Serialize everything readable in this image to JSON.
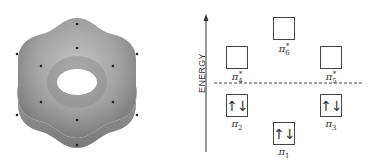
{
  "left": {
    "title": "benzene pi electron density surface",
    "surface_color": "#9a9a9a",
    "atoms": {
      "hydrogens": [
        [
          17,
          54
        ],
        [
          137,
          54
        ],
        [
          17,
          115
        ],
        [
          137,
          115
        ],
        [
          77,
          24
        ],
        [
          77,
          145
        ]
      ],
      "carbons": [
        [
          77,
          48
        ],
        [
          41,
          66
        ],
        [
          113,
          66
        ],
        [
          41,
          102
        ],
        [
          113,
          102
        ],
        [
          77,
          120
        ]
      ]
    }
  },
  "right": {
    "axis_label": "ENERGY",
    "orbitals": [
      {
        "id": "pi6",
        "symbol": "π",
        "sub": "6",
        "sup": "*",
        "occupied": false,
        "electrons": ""
      },
      {
        "id": "pi4",
        "symbol": "π",
        "sub": "4",
        "sup": "*",
        "occupied": false,
        "electrons": ""
      },
      {
        "id": "pi5",
        "symbol": "π",
        "sub": "5",
        "sup": "*",
        "occupied": false,
        "electrons": ""
      },
      {
        "id": "pi2",
        "symbol": "π",
        "sub": "2",
        "sup": "",
        "occupied": true,
        "electrons": "↑↓"
      },
      {
        "id": "pi3",
        "symbol": "π",
        "sub": "3",
        "sup": "",
        "occupied": true,
        "electrons": "↑↓"
      },
      {
        "id": "pi1",
        "symbol": "π",
        "sub": "1",
        "sup": "",
        "occupied": true,
        "electrons": "↑↓"
      }
    ]
  }
}
